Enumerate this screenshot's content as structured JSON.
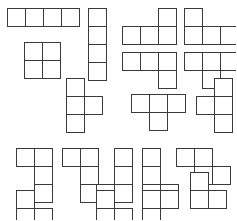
{
  "page": {
    "background_color": "#ffffff",
    "stroke_color": "#3a3a3a",
    "fill_color": "#ffffff",
    "stroke_width": 1,
    "cell_size": 18,
    "width": 236,
    "height": 220
  },
  "shapes": [
    {
      "name": "i-tetromino-horizontal",
      "label": "I",
      "x": 7,
      "y": 8,
      "cells": [
        [
          0,
          0
        ],
        [
          1,
          0
        ],
        [
          2,
          0
        ],
        [
          3,
          0
        ]
      ]
    },
    {
      "name": "l-tetromino-up-right",
      "label": "J",
      "x": 122,
      "y": 8,
      "cells": [
        [
          2,
          0
        ],
        [
          0,
          1
        ],
        [
          1,
          1
        ],
        [
          2,
          1
        ]
      ]
    },
    {
      "name": "j-tetromino-up-left",
      "label": "L",
      "x": 184,
      "y": 8,
      "cells": [
        [
          0,
          0
        ],
        [
          0,
          1
        ],
        [
          1,
          1
        ],
        [
          2,
          1
        ]
      ]
    },
    {
      "name": "i-tetromino-vertical",
      "label": "I",
      "x": 88,
      "y": 8,
      "cells": [
        [
          0,
          0
        ],
        [
          0,
          1
        ],
        [
          0,
          2
        ],
        [
          0,
          3
        ]
      ]
    },
    {
      "name": "o-tetromino-square",
      "label": "O",
      "x": 24,
      "y": 42,
      "cells": [
        [
          0,
          0
        ],
        [
          1,
          0
        ],
        [
          0,
          1
        ],
        [
          1,
          1
        ]
      ]
    },
    {
      "name": "j-tetromino-down-right",
      "label": "J",
      "x": 122,
      "y": 52,
      "cells": [
        [
          0,
          0
        ],
        [
          1,
          0
        ],
        [
          2,
          0
        ],
        [
          2,
          1
        ]
      ]
    },
    {
      "name": "t-tetromino-down",
      "label": "T",
      "x": 184,
      "y": 52,
      "cells": [
        [
          0,
          0
        ],
        [
          1,
          0
        ],
        [
          2,
          0
        ],
        [
          1,
          1
        ]
      ]
    },
    {
      "name": "t-tetromino-right-upper",
      "label": "T",
      "x": 66,
      "y": 78,
      "cells": [
        [
          0,
          0
        ],
        [
          0,
          1
        ],
        [
          1,
          1
        ],
        [
          0,
          2
        ]
      ]
    },
    {
      "name": "t-tetromino-down-mid",
      "label": "T",
      "x": 131,
      "y": 94,
      "cells": [
        [
          0,
          0
        ],
        [
          1,
          0
        ],
        [
          2,
          0
        ],
        [
          1,
          1
        ]
      ]
    },
    {
      "name": "s-tetromino-vertical-left",
      "label": "S",
      "x": 196,
      "y": 78,
      "cells": [
        [
          1,
          0
        ],
        [
          0,
          1
        ],
        [
          1,
          1
        ],
        [
          1,
          2
        ]
      ]
    },
    {
      "name": "t-tetromino-left-lower",
      "label": "T",
      "x": 16,
      "y": 148,
      "cells": [
        [
          0,
          0
        ],
        [
          1,
          0
        ],
        [
          1,
          1
        ],
        [
          1,
          2
        ]
      ]
    },
    {
      "name": "j-tetromino-tall-left",
      "label": "J",
      "x": 62,
      "y": 148,
      "cells": [
        [
          0,
          0
        ],
        [
          1,
          0
        ],
        [
          1,
          1
        ],
        [
          1,
          2
        ]
      ]
    },
    {
      "name": "s-tetromino-lower-left",
      "label": "S",
      "x": 96,
      "y": 148,
      "cells": [
        [
          1,
          0
        ],
        [
          1,
          1
        ],
        [
          0,
          2
        ],
        [
          1,
          2
        ]
      ]
    },
    {
      "name": "l-tetromino-lower-right",
      "label": "L",
      "x": 142,
      "y": 148,
      "cells": [
        [
          0,
          0
        ],
        [
          0,
          1
        ],
        [
          0,
          2
        ],
        [
          1,
          2
        ]
      ]
    },
    {
      "name": "s-tetromino-offset-right",
      "label": "S",
      "x": 176,
      "y": 148,
      "cells": [
        [
          0,
          0
        ],
        [
          1,
          0
        ],
        [
          1,
          1
        ],
        [
          2,
          1
        ]
      ]
    },
    {
      "name": "j-tetromino-bottom-left",
      "label": "J",
      "x": 16,
      "y": 190,
      "cells": [
        [
          0,
          0
        ],
        [
          0,
          1
        ],
        [
          1,
          1
        ]
      ]
    },
    {
      "name": "t-tetromino-bottom-mid",
      "label": "T",
      "x": 96,
      "y": 190,
      "cells": [
        [
          0,
          0
        ],
        [
          0,
          1
        ],
        [
          1,
          1
        ]
      ]
    },
    {
      "name": "s-tetromino-bottom-center",
      "label": "S",
      "x": 142,
      "y": 190,
      "cells": [
        [
          0,
          0
        ],
        [
          1,
          0
        ],
        [
          0,
          1
        ]
      ]
    },
    {
      "name": "l-tetromino-bottom-right",
      "label": "L",
      "x": 190,
      "y": 172,
      "cells": [
        [
          0,
          0
        ],
        [
          0,
          1
        ],
        [
          1,
          1
        ]
      ]
    }
  ]
}
